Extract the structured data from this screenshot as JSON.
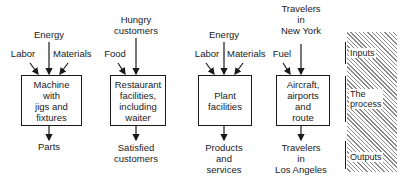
{
  "diagram": {
    "type": "input-process-output examples",
    "systems": [
      {
        "id": "machine",
        "inputs": {
          "top": "Energy",
          "left": "Labor",
          "right": "Materials"
        },
        "process": "Machine\nwith\njigs and\nfixtures",
        "output": "Parts"
      },
      {
        "id": "restaurant",
        "inputs": {
          "top": "Hungry\ncustomers",
          "left": "Food"
        },
        "process": "Restaurant\nfacilities,\nincluding\nwaiter",
        "output": "Satisfied\ncustomers"
      },
      {
        "id": "plant",
        "inputs": {
          "top": "Energy",
          "left": "Labor",
          "right": "Materials"
        },
        "process": "Plant\nfacilities",
        "output": "Products\nand\nservices"
      },
      {
        "id": "airline",
        "inputs": {
          "top": "Travelers\nin\nNew York",
          "left": "Fuel"
        },
        "process": "Aircraft,\nairports\nand\nroute",
        "output": "Travelers\nin\nLos Angeles"
      }
    ],
    "legend": {
      "items": [
        "Inputs",
        "The\nprocess",
        "Outputs"
      ]
    }
  }
}
